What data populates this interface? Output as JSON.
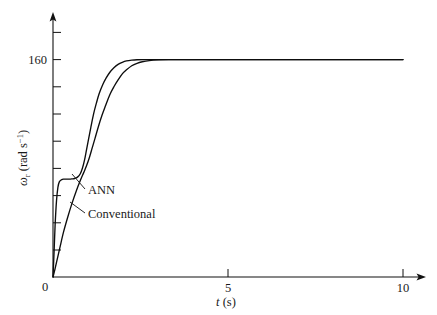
{
  "chart_data": {
    "type": "line",
    "title": "",
    "xlabel": "t (s)",
    "ylabel": "ωr (rad s⁻¹)",
    "xlim": [
      0,
      10.6
    ],
    "ylim": [
      0,
      183
    ],
    "grid": false,
    "legend_position": "inline-annotations",
    "xticks": [
      5,
      10
    ],
    "xtick_labels": [
      "5",
      "10"
    ],
    "yticks": [
      0,
      160
    ],
    "ytick_labels": [
      "0",
      "160"
    ],
    "y_minor_ticks": [
      20,
      40,
      60,
      80,
      100,
      120,
      140,
      180
    ],
    "series": [
      {
        "name": "ANN",
        "annotation": "ANN",
        "x": [
          0.0,
          0.03,
          0.06,
          0.1,
          0.14,
          0.18,
          0.24,
          0.3,
          0.38,
          0.46,
          0.54,
          0.62,
          0.7,
          0.78,
          0.84,
          0.9,
          0.96,
          1.02,
          1.08,
          1.16,
          1.24,
          1.32,
          1.42,
          1.52,
          1.62,
          1.74,
          1.86,
          1.98,
          2.1,
          2.25,
          2.4,
          2.6,
          2.8,
          3.1,
          3.5,
          4.0,
          5.0,
          6.0,
          7.0,
          8.0,
          9.0,
          10.0
        ],
        "y": [
          0,
          18,
          38,
          56,
          66,
          70,
          71.5,
          72,
          72,
          72,
          72.2,
          72.5,
          73.5,
          76,
          80,
          86,
          94,
          102,
          110,
          120,
          128,
          135,
          141.5,
          146.5,
          150.5,
          154,
          156.5,
          158,
          159,
          159.6,
          159.9,
          160,
          160,
          160,
          160,
          160,
          160,
          160,
          160,
          160,
          160,
          160
        ]
      },
      {
        "name": "Conventional",
        "annotation": "Conventional",
        "x": [
          0.0,
          0.05,
          0.12,
          0.2,
          0.3,
          0.42,
          0.54,
          0.66,
          0.78,
          0.88,
          0.96,
          1.04,
          1.12,
          1.2,
          1.3,
          1.4,
          1.5,
          1.62,
          1.74,
          1.86,
          1.98,
          2.1,
          2.25,
          2.4,
          2.55,
          2.75,
          3.0,
          3.3,
          3.8,
          4.5,
          5.0,
          6.0,
          7.0,
          8.0,
          9.0,
          10.0
        ],
        "y": [
          0,
          5,
          13,
          22,
          33,
          44,
          54,
          63,
          71,
          77,
          82,
          88,
          95,
          102,
          111,
          119,
          126,
          134,
          140,
          145,
          149.5,
          152.5,
          155.5,
          157.3,
          158.4,
          159.3,
          159.8,
          160,
          160,
          160,
          160,
          160,
          160,
          160,
          160,
          160
        ]
      }
    ],
    "annotations": [
      {
        "text": "ANN",
        "x_px": 88,
        "y_px": 193
      },
      {
        "text": "Conventional",
        "x_px": 88,
        "y_px": 217
      }
    ]
  },
  "axis": {
    "y_label_symbol": "ω",
    "y_label_sub": "r",
    "y_label_rest": " (rad s",
    "y_label_sup": "−1",
    "y_label_close": ")",
    "x_label_symbol": "t",
    "x_label_rest": " (s)"
  }
}
